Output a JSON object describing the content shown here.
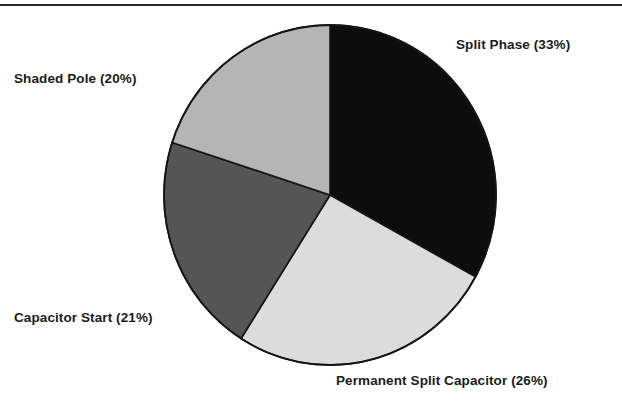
{
  "figure": {
    "name": "single-phase-motor-type-distribution-pie-chart",
    "background_color": "#ffffff",
    "top_rule_color": "#2b2b2b",
    "label_color": "#1b1b1b"
  },
  "chart_data": {
    "type": "pie",
    "title": "",
    "subtitle": "",
    "xlabel": "",
    "ylabel": "",
    "legend_position": "outside-labels",
    "grid": false,
    "start_angle_deg": 0,
    "direction": "clockwise",
    "units": "percent",
    "total": 100,
    "categories": [
      "Split Phase",
      "Permanent Split Capacitor",
      "Capacitor Start",
      "Shaded Pole"
    ],
    "values": [
      33,
      26,
      21,
      20
    ],
    "labels": [
      "Split Phase (33%)",
      "Permanent Split Capacitor (26%)",
      "Capacitor Start (21%)",
      "Shaded Pole (20%)"
    ],
    "slices": [
      {
        "name": "Split Phase",
        "value": 33,
        "label": "Split Phase (33%)",
        "color": "#0d0d0d",
        "start_angle_deg": 0,
        "end_angle_deg": 118.8
      },
      {
        "name": "Permanent Split Capacitor",
        "value": 26,
        "label": "Permanent Split Capacitor (26%)",
        "color": "#dcdcdc",
        "start_angle_deg": 118.8,
        "end_angle_deg": 212.4
      },
      {
        "name": "Capacitor Start",
        "value": 21,
        "label": "Capacitor Start (21%)",
        "color": "#555555",
        "start_angle_deg": 212.4,
        "end_angle_deg": 288.0
      },
      {
        "name": "Shaded Pole",
        "value": 20,
        "label": "Shaded Pole (20%)",
        "color": "#b5b5b5",
        "start_angle_deg": 288.0,
        "end_angle_deg": 360.0
      }
    ]
  }
}
